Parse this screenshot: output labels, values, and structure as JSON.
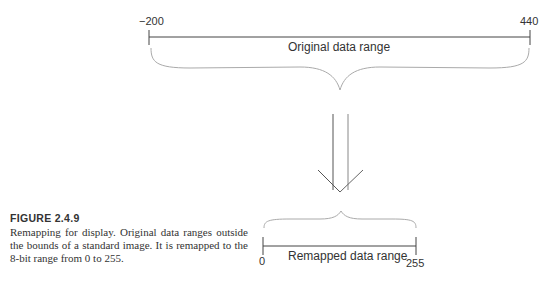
{
  "original_range": {
    "min_label": "−200",
    "max_label": "440",
    "label": "Original data range"
  },
  "remapped_range": {
    "min_label": "0",
    "max_label": "255",
    "label": "Remapped data range"
  },
  "caption": {
    "title": "FIGURE 2.4.9",
    "text": "Remapping for display. Original data ranges outside the bounds of a standard image. It is remapped to the 8-bit range from 0 to 255."
  },
  "colors": {
    "line": "#444444",
    "brace": "#aaaaaa",
    "text": "#333333"
  }
}
